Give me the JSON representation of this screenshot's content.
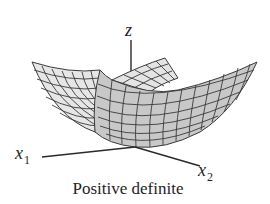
{
  "figure": {
    "caption": "Positive definite",
    "surface_type": "paraboloid (bowl opening upward)",
    "axes": {
      "z": {
        "label": "z"
      },
      "x1": {
        "label": "x",
        "subscript": "1"
      },
      "x2": {
        "label": "x",
        "subscript": "2"
      }
    },
    "colors": {
      "surface_front": "#c8c8c8",
      "surface_back": "#e4e4e4",
      "grid_line": "#3a3a3a",
      "axis_line": "#2a2a2a",
      "text": "#1e1e1e",
      "background": "#ffffff"
    }
  }
}
